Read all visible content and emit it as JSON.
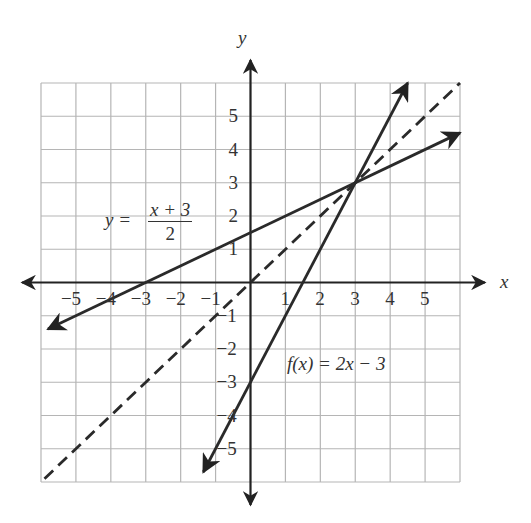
{
  "chart_data": {
    "type": "line",
    "title": "",
    "xlabel": "x",
    "ylabel": "y",
    "xlim": [
      -6,
      6
    ],
    "ylim": [
      -6,
      6
    ],
    "grid": true,
    "x_ticks": [
      -5,
      -4,
      -3,
      -2,
      -1,
      1,
      2,
      3,
      4,
      5
    ],
    "y_ticks": [
      5,
      4,
      3,
      2,
      1,
      -1,
      -2,
      -3,
      -4,
      -5
    ],
    "series": [
      {
        "name": "y = (x + 3)/2",
        "equation": "y = (x+3)/2",
        "style": "solid",
        "slope": 0.5,
        "intercept": 1.5,
        "x": [
          -5.8,
          6
        ],
        "y": [
          -1.4,
          4.5
        ]
      },
      {
        "name": "f(x) = 2x - 3",
        "equation": "f(x) = 2x - 3",
        "style": "solid",
        "slope": 2,
        "intercept": -3,
        "x": [
          -1.35,
          4.5
        ],
        "y": [
          -5.7,
          6
        ]
      },
      {
        "name": "y = x",
        "equation": "y = x",
        "style": "dashed",
        "slope": 1,
        "intercept": 0,
        "x": [
          -5.9,
          6
        ],
        "y": [
          -5.9,
          6
        ]
      }
    ],
    "intersection": {
      "x": 3,
      "y": 3
    },
    "annotations": [
      {
        "text": "y = (x + 3)/2",
        "near": [
          -3.5,
          1.7
        ]
      },
      {
        "text": "f(x) = 2x - 3",
        "near": [
          2.2,
          -2.5
        ]
      }
    ]
  },
  "labels": {
    "x_axis": "x",
    "y_axis": "y",
    "eq1_lhs": "y =",
    "eq1_num": "x + 3",
    "eq1_den": "2",
    "eq2": "f(x) = 2x − 3",
    "xticks": [
      "−5",
      "−4",
      "−3",
      "−2",
      "−1",
      "1",
      "2",
      "3",
      "4",
      "5"
    ],
    "yticks": [
      "5",
      "4",
      "3",
      "2",
      "1",
      "−1",
      "−2",
      "−3",
      "−4",
      "−5"
    ]
  }
}
